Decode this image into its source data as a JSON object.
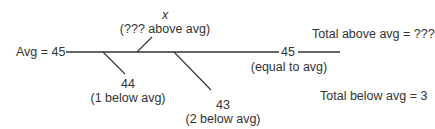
{
  "diagram": {
    "avg_label": "Avg = 45",
    "above": {
      "value": "x",
      "note": "(??? above avg)"
    },
    "equal": {
      "value": "45",
      "note": "(equal to avg)"
    },
    "below1": {
      "value": "44",
      "note": "(1 below avg)"
    },
    "below2": {
      "value": "43",
      "note": "(2 below avg)"
    },
    "total_above": "Total above avg = ???",
    "total_below": "Total below avg = 3",
    "line_color": "#333333"
  }
}
